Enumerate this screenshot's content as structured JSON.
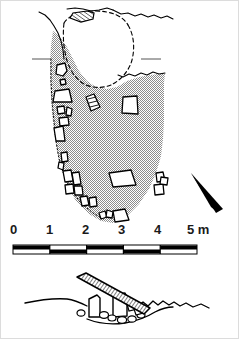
{
  "figure": {
    "type": "archaeological-site-plan",
    "views": [
      {
        "name": "plan-view",
        "label": ""
      },
      {
        "name": "cross-section-view",
        "label": ""
      }
    ]
  },
  "scale_bar": {
    "name": "scale-bar",
    "unit": "m",
    "unit_label": "5 m",
    "ticks": [
      "0",
      "1",
      "2",
      "3",
      "4",
      "5"
    ],
    "tick_values": [
      0,
      1,
      2,
      3,
      4,
      5
    ],
    "segment_count": 5,
    "segment_fills": [
      "white",
      "black",
      "white",
      "black",
      "white"
    ],
    "bar_color": "#000000",
    "x_start_px": 12,
    "x_end_px": 196
  },
  "north_arrow": {
    "name": "north-arrow",
    "label": "",
    "color": "#000000",
    "orientation": "points down-right"
  },
  "plan": {
    "mound_fill_color": "#9a9a9a",
    "outline_color": "#000000",
    "stone_fill_color": "#ffffff",
    "hatched_slab_color": "#000000",
    "baseline_tick_left": "",
    "baseline_tick_right": ""
  },
  "section": {
    "ground_line_color": "#000000",
    "capstone_hatch_color": "#000000",
    "chamber_outline_color": "#000000"
  },
  "colors": {
    "background": "#ffffff",
    "ink": "#000000",
    "fill_gray": "#9a9a9a",
    "frame": "#dcdcdc"
  }
}
